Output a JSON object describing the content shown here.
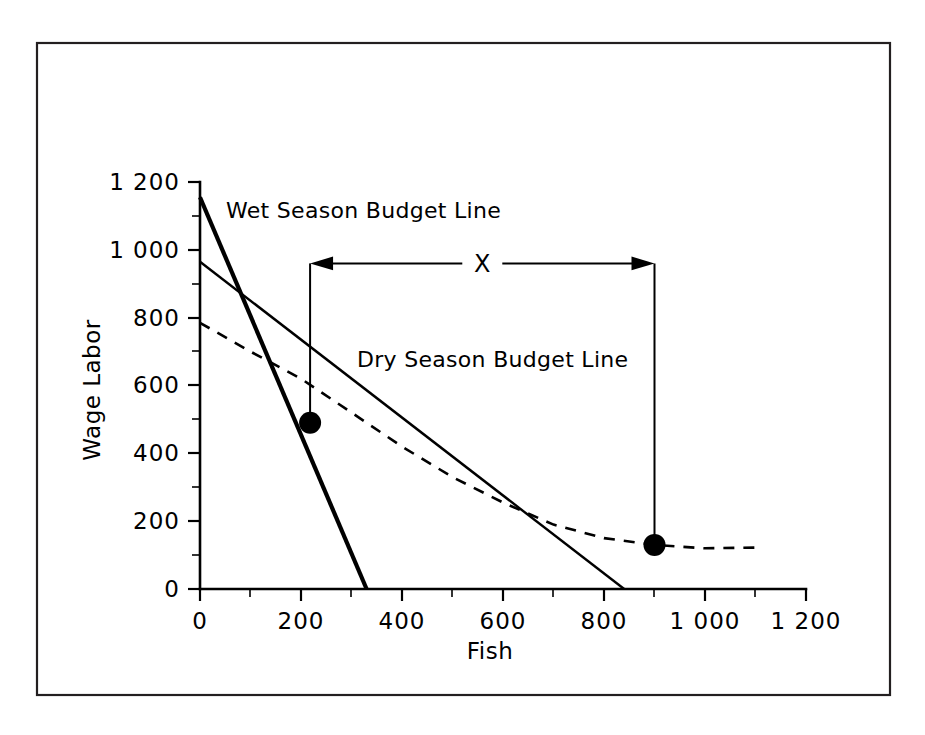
{
  "chart_data": {
    "type": "line",
    "title": "",
    "xlabel": "Fish",
    "ylabel": "Wage Labor",
    "xlim": [
      0,
      1200
    ],
    "ylim": [
      0,
      1200
    ],
    "grid": false,
    "legend_position": "inline-annotations",
    "x_ticks": [
      0,
      200,
      400,
      600,
      800,
      1000,
      1200
    ],
    "x_tick_labels": [
      "0",
      "200",
      "400",
      "600",
      "800",
      "1 000",
      "1 200"
    ],
    "x_minor_ticks": [
      100,
      300,
      500,
      700,
      900,
      1100
    ],
    "y_ticks": [
      0,
      200,
      400,
      600,
      800,
      1000,
      1200
    ],
    "y_tick_labels": [
      "0",
      "200",
      "400",
      "600",
      "800",
      "1 000",
      "1 200"
    ],
    "y_minor_ticks": [
      100,
      300,
      500,
      700,
      900,
      1100
    ],
    "series": [
      {
        "name": "Wet Season Budget Line",
        "style": "solid-thick",
        "label": "Wet Season Budget Line",
        "points": [
          [
            0,
            1155
          ],
          [
            330,
            0
          ]
        ]
      },
      {
        "name": "Dry Season Budget Line",
        "style": "solid-thin",
        "label": "Dry Season Budget Line",
        "points": [
          [
            0,
            965
          ],
          [
            840,
            0
          ]
        ]
      },
      {
        "name": "Indifference Curve",
        "style": "dashed",
        "label": "",
        "points": [
          [
            0,
            785
          ],
          [
            100,
            700
          ],
          [
            200,
            620
          ],
          [
            300,
            520
          ],
          [
            400,
            420
          ],
          [
            500,
            330
          ],
          [
            600,
            255
          ],
          [
            700,
            190
          ],
          [
            800,
            150
          ],
          [
            900,
            130
          ],
          [
            1000,
            120
          ],
          [
            1100,
            122
          ]
        ]
      }
    ],
    "markers": [
      {
        "name": "wet-season-optimum",
        "x": 218,
        "y": 490
      },
      {
        "name": "dry-season-optimum",
        "x": 900,
        "y": 130
      }
    ],
    "annotations": [
      {
        "name": "x-distance-annotation",
        "label": "X",
        "type": "double-headed-arrow",
        "from_x": 218,
        "to_x": 900,
        "at_y": 960,
        "drop_to_marker": true
      }
    ]
  },
  "labels": {
    "y_axis_title": "Wage Labor",
    "x_axis_title": "Fish",
    "wet_season": "Wet Season Budget Line",
    "dry_season": "Dry Season Budget Line",
    "x_annotation": "X"
  },
  "colors": {
    "foreground": "#000000",
    "frame": "#231f20",
    "background": "#ffffff"
  }
}
